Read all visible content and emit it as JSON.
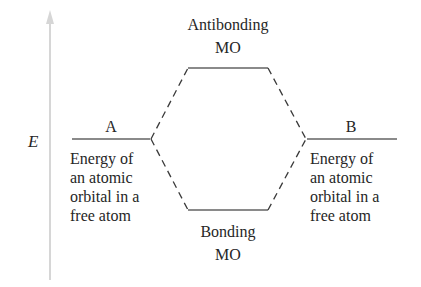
{
  "axis": {
    "label": "E",
    "direction": "up",
    "color": "#d0d0d0"
  },
  "levels": {
    "atom_a": {
      "label": "A",
      "description": [
        "Energy of",
        "an atomic",
        "orbital in a",
        "free atom"
      ]
    },
    "atom_b": {
      "label": "B",
      "description": [
        "Energy of",
        "an atomic",
        "orbital in a",
        "free atom"
      ]
    },
    "antibonding": {
      "label": [
        "Antibonding",
        "MO"
      ]
    },
    "bonding": {
      "label": [
        "Bonding",
        "MO"
      ]
    }
  },
  "colors": {
    "level_line": "#8a8a8a",
    "dash_line": "#3a3a3a",
    "text": "#262626"
  }
}
